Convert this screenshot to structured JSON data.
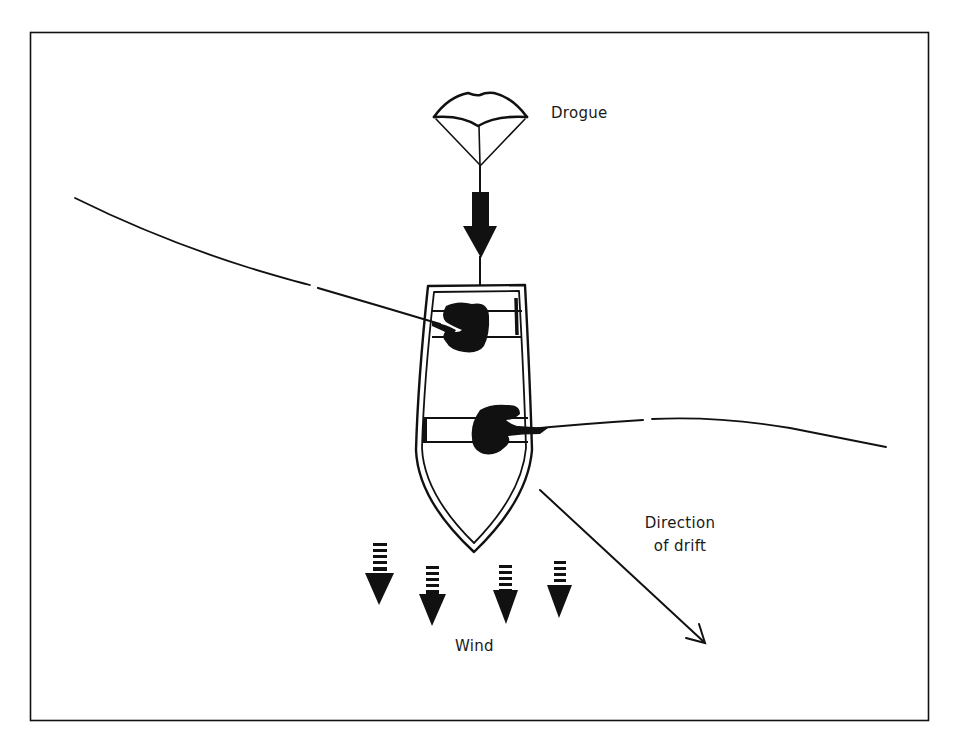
{
  "diagram": {
    "title": "",
    "type": "drift-fishing-with-drogue",
    "colors": {
      "ink": "#111111",
      "background": "#ffffff"
    },
    "labels": {
      "drogue": "Drogue",
      "direction_of_drift_line1": "Direction",
      "direction_of_drift_line2": "of drift",
      "wind": "Wind"
    },
    "elements": [
      {
        "id": "drogue",
        "shape": "parachute",
        "label": "Drogue"
      },
      {
        "id": "drogue-pull-arrow",
        "shape": "arrow",
        "direction": "down"
      },
      {
        "id": "boat",
        "shape": "boat-top-view",
        "occupants": 2
      },
      {
        "id": "angler-1",
        "shape": "person-silhouette",
        "position": "bow seat",
        "line_direction": "left"
      },
      {
        "id": "angler-2",
        "shape": "person-silhouette",
        "position": "middle seat",
        "line_direction": "right"
      },
      {
        "id": "fishing-line-left",
        "shape": "curve"
      },
      {
        "id": "fishing-line-right",
        "shape": "curve"
      },
      {
        "id": "wind-arrows",
        "shape": "striped-arrow",
        "count": 4,
        "direction": "down",
        "label": "Wind"
      },
      {
        "id": "drift-arrow",
        "shape": "arrow",
        "direction": "down-right",
        "label": "Direction of drift"
      }
    ]
  }
}
